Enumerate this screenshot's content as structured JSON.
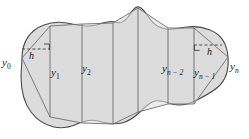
{
  "figure": {
    "canvas": {
      "width": 249,
      "height": 139
    },
    "colors": {
      "background": "#ffffff",
      "region_fill": "#dcdcdc",
      "outline_stroke": "#4a4a4a",
      "chord_stroke": "#6e6e6e",
      "ordinate_stroke": "#707070",
      "dash_stroke": "#3c3c3c",
      "label_text": "#1a1a1a"
    },
    "ordinates": [
      {
        "id": "y0",
        "base": "y",
        "sub": "0",
        "label_x": 2,
        "label_y": 57,
        "line_x": 22,
        "interactable": false
      },
      {
        "id": "y1",
        "base": "y",
        "sub": "1",
        "label_x": 51,
        "label_y": 67,
        "line_x": 50,
        "interactable": false
      },
      {
        "id": "y2",
        "base": "y",
        "sub": "2",
        "label_x": 82,
        "label_y": 63,
        "line_x": 82,
        "interactable": false
      },
      {
        "id": "yn-2",
        "base": "y",
        "sub": "n − 2",
        "label_x": 162,
        "label_y": 63,
        "line_x": 168,
        "interactable": false
      },
      {
        "id": "yn-1",
        "base": "y",
        "sub": "n − 1",
        "label_x": 194,
        "label_y": 67,
        "line_x": 194,
        "interactable": false
      },
      {
        "id": "yn",
        "base": "y",
        "sub": "n",
        "label_x": 230,
        "label_y": 61,
        "line_x": 228,
        "interactable": false
      }
    ],
    "width_markers": [
      {
        "id": "h-left",
        "label": "h",
        "label_x": 29,
        "label_y": 51,
        "dash_x1": 22,
        "dash_x2": 50,
        "dash_y": 49,
        "corner_side": "right",
        "interactable": false
      },
      {
        "id": "h-right",
        "label": "h",
        "label_x": 207,
        "label_y": 47,
        "dash_x1": 194,
        "dash_x2": 222,
        "dash_y": 45,
        "corner_side": "left",
        "interactable": false
      }
    ],
    "interior_ordinate_lines": [
      {
        "id": "line-y1",
        "x": 50,
        "y_top": 26,
        "y_bottom": 117
      },
      {
        "id": "line-y2",
        "x": 82,
        "y_top": 24,
        "y_bottom": 123
      },
      {
        "id": "line-mid1",
        "x": 113,
        "y_top": 23,
        "y_bottom": 124
      },
      {
        "id": "line-peak",
        "x": 138,
        "y_top": 8,
        "y_bottom": 112
      },
      {
        "id": "line-yn2",
        "x": 168,
        "y_top": 28,
        "y_bottom": 104
      },
      {
        "id": "line-yn1",
        "x": 194,
        "y_top": 28,
        "y_bottom": 104
      }
    ],
    "region_outline_path": "M 22,58 C 22,42 30,30 44,25 C 54,21 64,22 72,24 C 80,26 88,27 96,25 C 104,23 110,20 115,22 C 120,24 124,22 128,17 C 132,11 135,6 139,7 C 143,8 146,13 150,19 C 154,25 159,28 166,29 C 173,30 180,28 187,27 C 194,26 202,27 210,30 C 220,34 227,43 228,57 C 229,70 226,80 218,87 C 211,93 203,97 195,101 C 187,105 179,106 172,104 C 165,102 160,100 155,101 C 150,102 146,106 141,111 C 136,116 130,121 122,123 C 114,125 105,123 98,121 C 91,119 84,121 77,124 C 70,127 62,129 54,127 C 45,125 37,120 31,112 C 24,103 21,90 21,76 Z",
    "region_chord_path": "M 22,58 L 50,26 L 82,24 L 113,23 L 138,8 L 168,28 L 194,28 L 228,57 L 194,104 L 168,104 L 138,112 L 113,124 L 82,123 L 50,117 Z"
  }
}
